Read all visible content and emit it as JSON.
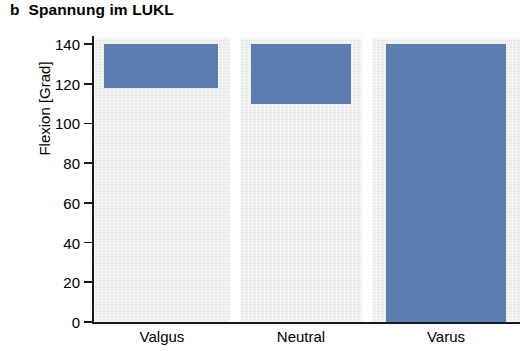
{
  "figure": {
    "panel_letter": "b",
    "title": "Spannung im LUKL",
    "bar_color": "#5d7db0",
    "panel_background": "#e9ebeb",
    "axis_color": "#1a1a1a"
  },
  "chart_data": {
    "type": "bar",
    "title": "Spannung im LUKL",
    "xlabel": "",
    "ylabel": "Flexion [Grad]",
    "ylim": [
      0,
      145
    ],
    "yticks": [
      0,
      20,
      40,
      60,
      80,
      100,
      120,
      140
    ],
    "ytick_labels": [
      "0",
      "20",
      "40",
      "60",
      "80",
      "100",
      "120",
      "140"
    ],
    "categories": [
      "Valgus",
      "Neutral",
      "Varus"
    ],
    "grid": false,
    "legend": null,
    "bars": [
      {
        "category": "Valgus",
        "low": 118,
        "high": 140
      },
      {
        "category": "Neutral",
        "low": 110,
        "high": 140
      },
      {
        "category": "Varus",
        "low": 0,
        "high": 140
      }
    ],
    "values": [
      140,
      140,
      140
    ],
    "series": [
      {
        "name": "range-low",
        "values": [
          118,
          110,
          0
        ]
      },
      {
        "name": "range-high",
        "values": [
          140,
          140,
          140
        ]
      }
    ]
  }
}
